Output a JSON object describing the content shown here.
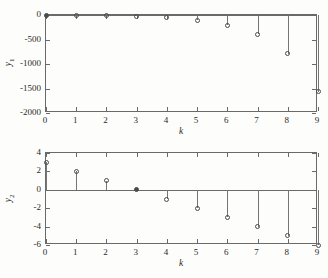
{
  "figure": {
    "background": "#fdfdfb",
    "axis_color": "#6a6a6a",
    "marker_color": "#4a4a4a",
    "stem_color": "#757575"
  },
  "chart_data": [
    {
      "type": "line",
      "plot_style": "stem",
      "id": "y1",
      "title": "",
      "xlabel": "k",
      "ylabel": "y1",
      "ylabel_display": "y",
      "ylabel_sub": "1",
      "x": [
        0,
        1,
        2,
        3,
        4,
        5,
        6,
        7,
        8,
        9
      ],
      "values": [
        0,
        -5,
        -10,
        -22,
        -48,
        -105,
        -205,
        -395,
        -790,
        -1570
      ],
      "xlim": [
        0,
        9
      ],
      "ylim": [
        -2000,
        0
      ],
      "xticks": [
        0,
        1,
        2,
        3,
        4,
        5,
        6,
        7,
        8,
        9
      ],
      "xticklabels": [
        "0",
        "1",
        "2",
        "3",
        "4",
        "5",
        "6",
        "7",
        "8",
        "9"
      ],
      "yticks": [
        0,
        -500,
        -1000,
        -1500,
        -2000
      ],
      "yticklabels": [
        "0",
        "-500",
        "-1000",
        "-1500",
        "-2000"
      ],
      "grid": false,
      "legend": null,
      "baseline": 0
    },
    {
      "type": "line",
      "plot_style": "stem",
      "id": "y2",
      "title": "",
      "xlabel": "k",
      "ylabel": "y2",
      "ylabel_display": "y",
      "ylabel_sub": "2",
      "x": [
        0,
        1,
        2,
        3,
        4,
        5,
        6,
        7,
        8,
        9
      ],
      "values": [
        3,
        2,
        1,
        0,
        -1,
        -2,
        -3,
        -4,
        -5,
        -6
      ],
      "xlim": [
        0,
        9
      ],
      "ylim": [
        -6,
        4
      ],
      "xticks": [
        0,
        1,
        2,
        3,
        4,
        5,
        6,
        7,
        8,
        9
      ],
      "xticklabels": [
        "0",
        "1",
        "2",
        "3",
        "4",
        "5",
        "6",
        "7",
        "8",
        "9"
      ],
      "yticks": [
        4,
        2,
        0,
        -2,
        -4,
        -6
      ],
      "yticklabels": [
        "4",
        "2",
        "0",
        "-2",
        "-4",
        "-6"
      ],
      "grid": false,
      "legend": null,
      "baseline": 0
    }
  ]
}
